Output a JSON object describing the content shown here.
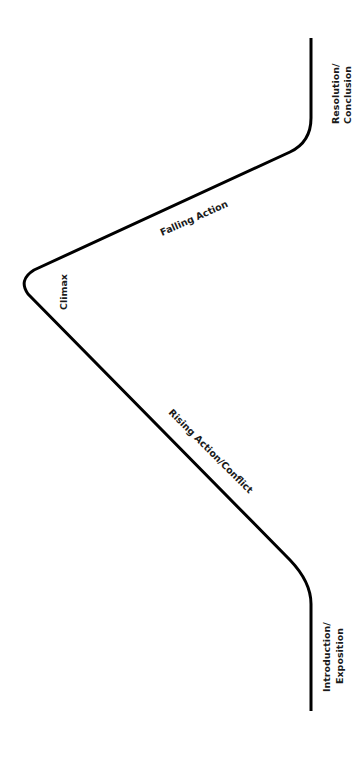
{
  "diagram": {
    "type": "plot-structure-arc",
    "orientation": "rotated 90deg clockwise",
    "line_color": "#000000",
    "background": "#ffffff",
    "labels": {
      "resolution_line1": "Resolution/",
      "resolution_line2": "Conclusion",
      "falling_action": "Falling Action",
      "climax": "Climax",
      "rising_action": "Rising Action/Conflict",
      "introduction_line1": "Introduction/",
      "introduction_line2": "Exposition"
    },
    "stages": [
      "Introduction/Exposition",
      "Rising Action/Conflict",
      "Climax",
      "Falling Action",
      "Resolution/Conclusion"
    ]
  }
}
